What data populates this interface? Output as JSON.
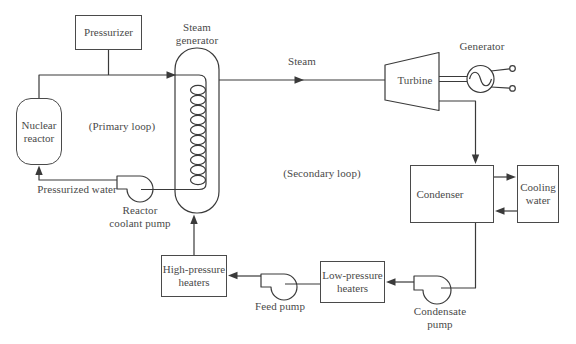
{
  "diagram": {
    "type": "pressurized-water-reactor-plant-schematic",
    "labels": {
      "pressurizer": "Pressurizer",
      "nuclear_reactor": "Nuclear reactor",
      "steam_generator": "Steam generator",
      "primary_loop": "(Primary loop)",
      "secondary_loop": "(Secondary loop)",
      "steam": "Steam",
      "turbine": "Turbine",
      "generator": "Generator",
      "condenser": "Condenser",
      "cooling_water": "Cooling water",
      "pressurized_water": "Pressurized water",
      "reactor_coolant_pump": "Reactor coolant pump",
      "high_pressure_heaters": "High-pressure heaters",
      "low_pressure_heaters": "Low-pressure heaters",
      "feed_pump": "Feed pump",
      "condensate_pump": "Condensate pump"
    },
    "colors": {
      "line": "#3a3a3a",
      "text": "#4a4a4a",
      "background": "#ffffff"
    }
  }
}
